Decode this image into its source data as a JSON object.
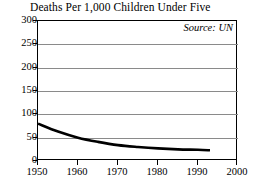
{
  "chart_data": {
    "type": "line",
    "title": "Deaths Per 1,000 Children Under Five",
    "xlabel": "",
    "ylabel": "",
    "annotation": "Source: UN",
    "grid": "horizontal",
    "legend": "none",
    "xlim": [
      1950,
      2000
    ],
    "ylim": [
      0,
      300
    ],
    "xticks": [
      1950,
      1960,
      1970,
      1980,
      1990,
      2000
    ],
    "yticks": [
      0,
      50,
      100,
      150,
      200,
      250,
      300
    ],
    "xtick_labels": [
      "1950",
      "1960",
      "1970",
      "1980",
      "1990",
      "2000"
    ],
    "ytick_labels": [
      "0",
      "50",
      "100",
      "150",
      "200",
      "250",
      "300"
    ],
    "series": [
      {
        "name": "Deaths per 1,000 children under five",
        "color": "#000000",
        "x": [
          1950,
          1955,
          1960,
          1965,
          1970,
          1975,
          1980,
          1985,
          1990,
          1993
        ],
        "values": [
          80,
          63,
          50,
          41,
          34,
          30,
          27,
          25,
          24,
          23
        ]
      }
    ]
  }
}
